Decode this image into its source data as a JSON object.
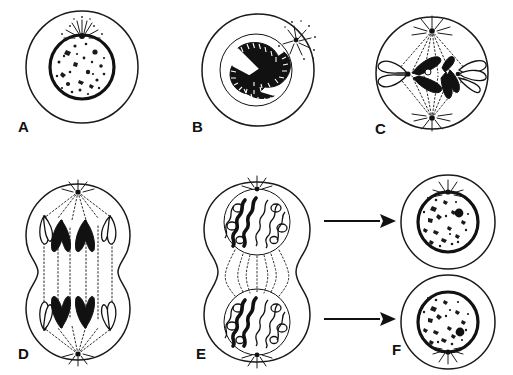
{
  "figure": {
    "type": "scientific-line-diagram",
    "style": "black-and-white ink drawing",
    "background_color": "#ffffff",
    "ink_color": "#111111",
    "canvas": {
      "width": 513,
      "height": 375
    }
  },
  "panels": [
    {
      "id": "A",
      "label": "A",
      "label_pos": {
        "x": 18,
        "y": 118
      },
      "stage": "interphase",
      "description": "Round cell with intact nuclear envelope, speckled chromatin and a centrosome with astral rays at the top of the nucleus",
      "cell": {
        "cx": 82,
        "cy": 67,
        "r": 56
      },
      "nucleus": {
        "cx": 82,
        "cy": 67,
        "r": 32
      },
      "features": [
        "plasma-membrane",
        "nuclear-envelope",
        "chromatin-speckles",
        "centrosome",
        "astral-rays"
      ]
    },
    {
      "id": "B",
      "label": "B",
      "label_pos": {
        "x": 192,
        "y": 118
      },
      "stage": "prophase",
      "description": "Condensed banded chromosomes coiled inside the still-present nuclear envelope; centrosome with aster at upper right",
      "cell": {
        "cx": 258,
        "cy": 70,
        "r": 56
      },
      "nucleus": {
        "cx": 256,
        "cy": 70,
        "r": 36
      },
      "features": [
        "condensed-chromosomes",
        "nuclear-envelope",
        "centrosome",
        "astral-rays"
      ]
    },
    {
      "id": "C",
      "label": "C",
      "label_pos": {
        "x": 375,
        "y": 120
      },
      "stage": "metaphase",
      "description": "Chromosomes aligned on the equatorial plate between two spindle poles; nuclear envelope gone",
      "cell": {
        "cx": 432,
        "cy": 73,
        "r": 56
      },
      "poles": [
        {
          "x": 432,
          "y": 29
        },
        {
          "x": 432,
          "y": 120
        }
      ],
      "features": [
        "spindle-fibers",
        "metaphase-plate",
        "centrioles",
        "chromosomes"
      ]
    },
    {
      "id": "D",
      "label": "D",
      "label_pos": {
        "x": 18,
        "y": 348
      },
      "stage": "anaphase",
      "description": "Sister chromatids as V shapes pulled toward opposite poles; cell elongated and starting to furrow",
      "cell": {
        "cx": 78,
        "cy": 272,
        "rx": 52,
        "ry": 90
      },
      "poles": [
        {
          "x": 78,
          "y": 189
        },
        {
          "x": 78,
          "y": 355
        }
      ],
      "features": [
        "separating-chromatids",
        "spindle-fibers",
        "cleavage-furrow"
      ]
    },
    {
      "id": "E",
      "label": "E",
      "label_pos": {
        "x": 196,
        "y": 348
      },
      "stage": "telophase",
      "description": "Two daughter nuclei reforming with decondensing looped chromosomes; deep cleavage furrow divides the cell",
      "cell": {
        "cx": 257,
        "cy": 272,
        "rx": 52,
        "ry": 92
      },
      "nuclei": [
        {
          "cx": 257,
          "cy": 222,
          "r": 33
        },
        {
          "cx": 257,
          "cy": 322,
          "r": 33
        }
      ],
      "features": [
        "daughter-nuclei",
        "decondensing-chromosomes",
        "cleavage-furrow",
        "centrosomes"
      ]
    },
    {
      "id": "F",
      "label": "F",
      "label_pos": {
        "x": 392,
        "y": 344
      },
      "stage": "interphase-daughter-cells",
      "description": "Two separate daughter cells, each with a nucleus containing a nucleolus and a centrosome with astral rays",
      "cells": [
        {
          "cx": 448,
          "cy": 222,
          "r": 47,
          "nucleus_r": 30,
          "nucleolus": {
            "x": 459,
            "y": 213
          }
        },
        {
          "cx": 448,
          "cy": 322,
          "r": 47,
          "nucleus_r": 30,
          "nucleolus": {
            "x": 460,
            "y": 332
          }
        }
      ],
      "features": [
        "plasma-membrane",
        "nucleus",
        "nucleolus",
        "centrosome",
        "astral-rays"
      ]
    }
  ],
  "arrows": [
    {
      "name": "arrow-e-to-f-top",
      "from": "E",
      "to": "F-top",
      "x1": 325,
      "y1": 220,
      "x2": 392,
      "y2": 220,
      "direction": "right"
    },
    {
      "name": "arrow-e-to-f-bottom",
      "from": "E",
      "to": "F-bottom",
      "x1": 325,
      "y1": 318,
      "x2": 392,
      "y2": 318,
      "direction": "right"
    }
  ],
  "sequence_order": [
    "A",
    "B",
    "C",
    "D",
    "E",
    "F"
  ]
}
